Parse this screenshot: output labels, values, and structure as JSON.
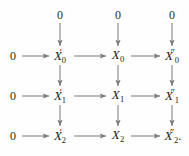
{
  "diagram": {
    "kind": "commutative-diagram",
    "title": "",
    "colors": {
      "arrow": "#7d7d7d",
      "text": "#1b1b1b",
      "background": "#fefefe"
    },
    "columns": [
      {
        "name": "zero-left",
        "x": 13
      },
      {
        "name": "prime",
        "x": 60
      },
      {
        "name": "middle",
        "x": 118
      },
      {
        "name": "double-prime",
        "x": 172
      }
    ],
    "rows": [
      {
        "name": "top-zeros",
        "y": 15
      },
      {
        "name": "row-0",
        "y": 56
      },
      {
        "name": "row-1",
        "y": 96
      },
      {
        "name": "row-2",
        "y": 136
      }
    ],
    "nodes": {
      "top_zero_prime": {
        "text": "0",
        "x": 60,
        "y": 15
      },
      "top_zero_middle": {
        "text": "0",
        "x": 118,
        "y": 15
      },
      "top_zero_double": {
        "text": "0",
        "x": 172,
        "y": 15
      },
      "row0_zero": {
        "text": "0",
        "x": 13,
        "y": 56
      },
      "row0_prime": {
        "base": "X",
        "sub": "0",
        "prime": "′",
        "x": 60,
        "y": 56
      },
      "row0_middle": {
        "base": "X",
        "sub": "0",
        "prime": "",
        "x": 118,
        "y": 56
      },
      "row0_double": {
        "base": "X",
        "sub": "0",
        "prime": "″",
        "x": 172,
        "y": 56
      },
      "row1_zero": {
        "text": "0",
        "x": 13,
        "y": 96
      },
      "row1_prime": {
        "base": "X",
        "sub": "1",
        "prime": "′",
        "x": 60,
        "y": 96
      },
      "row1_middle": {
        "base": "X",
        "sub": "1",
        "prime": "",
        "x": 118,
        "y": 96
      },
      "row1_double": {
        "base": "X",
        "sub": "1",
        "prime": "″",
        "x": 172,
        "y": 96
      },
      "row2_zero": {
        "text": "0",
        "x": 13,
        "y": 136
      },
      "row2_prime": {
        "base": "X",
        "sub": "2",
        "prime": "′",
        "x": 60,
        "y": 136
      },
      "row2_middle": {
        "base": "X",
        "sub": "2",
        "prime": "",
        "x": 118,
        "y": 136
      },
      "row2_double": {
        "base": "X",
        "sub": "2",
        "prime": "″",
        "tail": ".",
        "x": 172,
        "y": 136
      }
    },
    "arrow_count": {
      "horizontal": 9,
      "vertical": 9,
      "total": 18
    }
  }
}
